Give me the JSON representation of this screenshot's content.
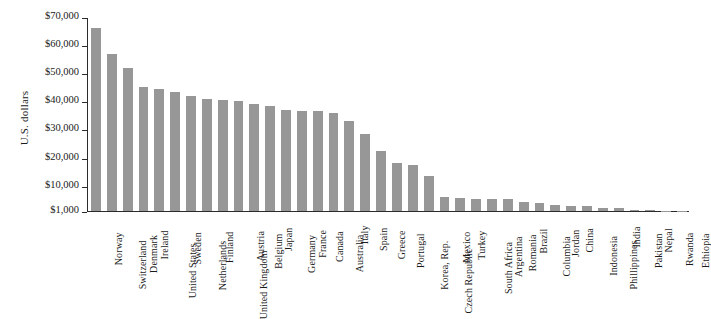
{
  "chart_data": {
    "type": "bar",
    "title": "",
    "xlabel": "",
    "ylabel": "U.S. dollars",
    "ylim": [
      1000,
      70000
    ],
    "ytick_values": [
      1000,
      10000,
      20000,
      30000,
      40000,
      50000,
      60000,
      70000
    ],
    "ytick_labels": [
      "$1,000",
      "$10,000",
      "$20,000",
      "$30,000",
      "$40,000",
      "$50,000",
      "$60,000",
      "$70,000"
    ],
    "grid": false,
    "legend": "none",
    "bar_color": "#979797",
    "axis_color": "#2b2b2b",
    "categories": [
      "Norway",
      "Switzerland",
      "Denmark",
      "Ireland",
      "United States",
      "Sweden",
      "Netherlands",
      "Finland",
      "United Kingdom",
      "Austria",
      "Belgium",
      "Japan",
      "Germany",
      "France",
      "Canada",
      "Australia",
      "Italy",
      "Spain",
      "Greece",
      "Portugal",
      "Korea, Rep.",
      "Czech Republic",
      "Mexico",
      "Turkey",
      "South Africa",
      "Argentina",
      "Romania",
      "Brazil",
      "Columbia",
      "Jordan",
      "China",
      "Indonesia",
      "Phillippines",
      "India",
      "Pakistan",
      "Nepal",
      "Rwanda",
      "Ethiopia"
    ],
    "values": [
      66000,
      57000,
      52000,
      45000,
      44500,
      43500,
      42000,
      41000,
      40500,
      40000,
      39000,
      38500,
      37000,
      36500,
      36500,
      36000,
      33000,
      28500,
      22500,
      18000,
      17500,
      13500,
      6000,
      5600,
      5400,
      5300,
      5300,
      4200,
      3800,
      3300,
      2900,
      2700,
      2200,
      1900,
      1500,
      1200,
      1100,
      1050
    ]
  }
}
